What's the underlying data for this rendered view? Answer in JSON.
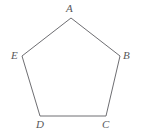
{
  "figure": {
    "kind": "geometry-diagram",
    "shape_name": "pentagon",
    "background_color": "#ffffff",
    "stroke_color": "#6e6e72",
    "stroke_width": 1,
    "label_color": "#58585a",
    "canvas": {
      "width": 143,
      "height": 138
    },
    "vertices": [
      {
        "id": "A",
        "label": "A",
        "x": 71,
        "y": 18,
        "label_x": 66,
        "label_y": 3
      },
      {
        "id": "B",
        "label": "B",
        "x": 120,
        "y": 56,
        "label_x": 123,
        "label_y": 50
      },
      {
        "id": "C",
        "label": "C",
        "x": 106,
        "y": 116,
        "label_x": 102,
        "label_y": 119
      },
      {
        "id": "D",
        "label": "D",
        "x": 40,
        "y": 116,
        "label_x": 36,
        "label_y": 119
      },
      {
        "id": "E",
        "label": "E",
        "x": 22,
        "y": 56,
        "label_x": 11,
        "label_y": 50
      }
    ],
    "edges": [
      {
        "from": "A",
        "to": "B"
      },
      {
        "from": "B",
        "to": "C"
      },
      {
        "from": "C",
        "to": "D"
      },
      {
        "from": "D",
        "to": "E"
      },
      {
        "from": "E",
        "to": "A"
      }
    ]
  }
}
